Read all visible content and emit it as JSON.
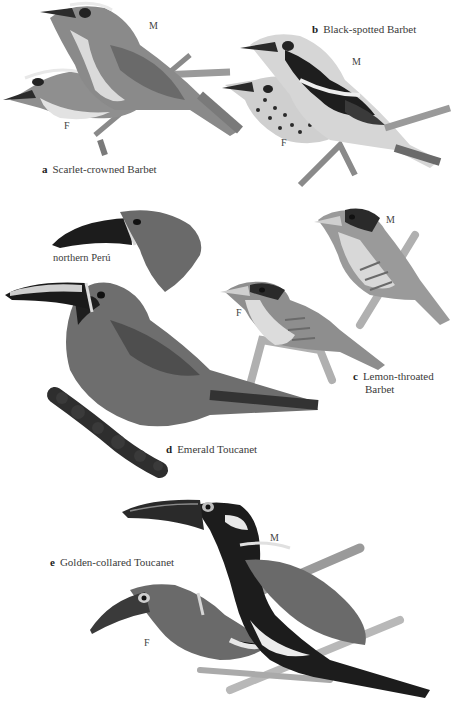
{
  "plate": {
    "species": [
      {
        "letter": "a",
        "name": "Scarlet-crowned Barbet",
        "sexes": [
          "M",
          "F"
        ]
      },
      {
        "letter": "b",
        "name": "Black-spotted Barbet",
        "sexes": [
          "M",
          "F"
        ]
      },
      {
        "letter": "c",
        "name_line1": "Lemon-throated",
        "name_line2": "Barbet",
        "sexes": [
          "M",
          "F"
        ]
      },
      {
        "letter": "d",
        "name": "Emerald Toucanet",
        "variant_label": "northern Perú"
      },
      {
        "letter": "e",
        "name": "Golden-collared Toucanet",
        "sexes": [
          "M",
          "F"
        ]
      }
    ]
  },
  "colors": {
    "background": "#ffffff",
    "plumage_dark": "#1e1e1e",
    "plumage_mid": "#6e6e6e",
    "plumage_light": "#b8b8b8",
    "pale": "#e4e4e4",
    "text": "#3a3a3a"
  }
}
